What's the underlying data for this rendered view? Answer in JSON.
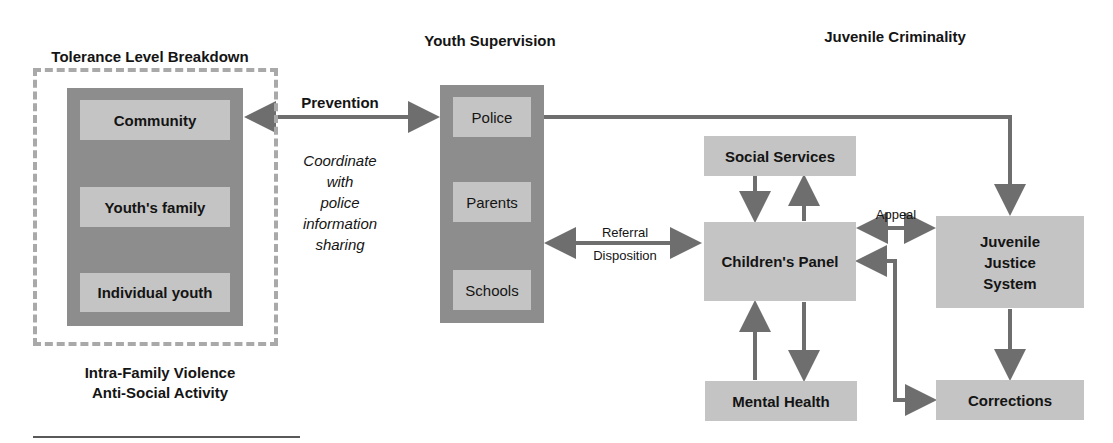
{
  "sections": {
    "tolerance": {
      "title": "Tolerance Level Breakdown",
      "levels": [
        "Community",
        "Youth's family",
        "Individual youth"
      ],
      "caption_line1": "Intra-Family Violence",
      "caption_line2": "Anti-Social Activity"
    },
    "supervision": {
      "title": "Youth Supervision",
      "items": [
        "Police",
        "Parents",
        "Schools"
      ]
    },
    "criminality": {
      "title": "Juvenile Criminality",
      "social_services": "Social Services",
      "childrens_panel": "Children's Panel",
      "mental_health": "Mental Health",
      "juvenile_justice_line1": "Juvenile",
      "juvenile_justice_line2": "Justice",
      "juvenile_justice_line3": "System",
      "corrections": "Corrections"
    }
  },
  "connectors": {
    "prevention": "Prevention",
    "coordinate_note": [
      "Coordinate",
      "with",
      "police",
      "information",
      "sharing"
    ],
    "referral": "Referral",
    "disposition": "Disposition",
    "appeal": "Appeal"
  },
  "colors": {
    "arrow": "#6e6e6e",
    "box_fill": "#c4c4c4",
    "panel_fill": "#8d8d8d",
    "dashed_border": "#a9a9a9"
  }
}
